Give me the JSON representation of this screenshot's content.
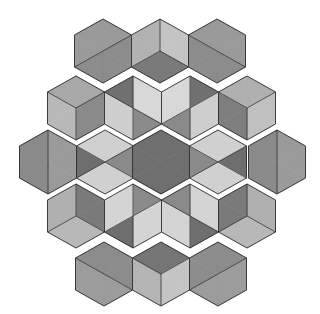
{
  "figure": {
    "width": 320,
    "height": 314,
    "background": "#ffffff",
    "hex": {
      "half_width": 28.5,
      "half_height": 32,
      "shoulder": 16
    },
    "triangle_order": [
      "top-upperright",
      "upperright-lowerright",
      "lowerright-bottom",
      "bottom-lowerleft",
      "lowerleft-upperleft",
      "upperleft-top"
    ],
    "palette": {
      "dark": "#6f6f6f",
      "medium_dark": "#8a8a8a",
      "medium": "#9a9a9a",
      "light_medium": "#b4b4b4",
      "light": "#d2d2d2"
    },
    "rows": [
      {
        "name": "row-1",
        "hexes": [
          {
            "cx": 103,
            "cy": 51,
            "fills": [
              "#9a9a9a",
              "#8c8c8c",
              "#8c8c8c",
              "#8c8c8c",
              "#9a9a9a",
              "#9a9a9a"
            ]
          },
          {
            "cx": 160,
            "cy": 51,
            "fills": [
              "#c4c4c4",
              "#c4c4c4",
              "#7a7a7a",
              "#7a7a7a",
              "#b2b2b2",
              "#b2b2b2"
            ]
          },
          {
            "cx": 217,
            "cy": 51,
            "fills": [
              "#9a9a9a",
              "#9a9a9a",
              "#8c8c8c",
              "#8c8c8c",
              "#8c8c8c",
              "#9a9a9a"
            ]
          }
        ]
      },
      {
        "name": "row-2",
        "hexes": [
          {
            "cx": 76,
            "cy": 108,
            "fills": [
              "#a8a8a8",
              "#8a8a8a",
              "#8a8a8a",
              "#b8b8b8",
              "#b8b8b8",
              "#a8a8a8"
            ]
          },
          {
            "cx": 133,
            "cy": 108,
            "fills": [
              "#d8d8d8",
              "#d8d8d8",
              "#8a8a8a",
              "#cecece",
              "#cecece",
              "#707070"
            ]
          },
          {
            "cx": 190,
            "cy": 108,
            "fills": [
              "#707070",
              "#cecece",
              "#cecece",
              "#8a8a8a",
              "#d8d8d8",
              "#d8d8d8"
            ]
          },
          {
            "cx": 247,
            "cy": 108,
            "fills": [
              "#b0b0b0",
              "#c0c0c0",
              "#c0c0c0",
              "#7e7e7e",
              "#7e7e7e",
              "#b0b0b0"
            ]
          }
        ]
      },
      {
        "name": "row-3",
        "hexes": [
          {
            "cx": 48,
            "cy": 162,
            "fills": [
              "#9a9a9a",
              "#9a9a9a",
              "#9a9a9a",
              "#8a8a8a",
              "#8a8a8a",
              "#8a8a8a"
            ]
          },
          {
            "cx": 105,
            "cy": 162,
            "fills": [
              "#d0d0d0",
              "#8a8a8a",
              "#d0d0d0",
              "#d0d0d0",
              "#6e6e6e",
              "#d0d0d0"
            ]
          },
          {
            "cx": 161,
            "cy": 162,
            "fills": [
              "#6f6f6f",
              "#6f6f6f",
              "#6f6f6f",
              "#6f6f6f",
              "#6f6f6f",
              "#6f6f6f"
            ]
          },
          {
            "cx": 218,
            "cy": 162,
            "fills": [
              "#d0d0d0",
              "#6e6e6e",
              "#d0d0d0",
              "#d0d0d0",
              "#8a8a8a",
              "#d0d0d0"
            ]
          },
          {
            "cx": 277,
            "cy": 162,
            "fills": [
              "#9a9a9a",
              "#9a9a9a",
              "#9a9a9a",
              "#8a8a8a",
              "#8a8a8a",
              "#8a8a8a"
            ]
          }
        ]
      },
      {
        "name": "row-4",
        "hexes": [
          {
            "cx": 76,
            "cy": 216,
            "fills": [
              "#7a7a7a",
              "#7a7a7a",
              "#b8b8b8",
              "#b8b8b8",
              "#b0b0b0",
              "#b0b0b0"
            ]
          },
          {
            "cx": 133,
            "cy": 216,
            "fills": [
              "#8a8a8a",
              "#d4d4d4",
              "#d4d4d4",
              "#6e6e6e",
              "#d4d4d4",
              "#d4d4d4"
            ]
          },
          {
            "cx": 190,
            "cy": 216,
            "fills": [
              "#d4d4d4",
              "#d4d4d4",
              "#6e6e6e",
              "#d4d4d4",
              "#d4d4d4",
              "#8a8a8a"
            ]
          },
          {
            "cx": 247,
            "cy": 216,
            "fills": [
              "#b0b0b0",
              "#b0b0b0",
              "#b8b8b8",
              "#b8b8b8",
              "#7a7a7a",
              "#7a7a7a"
            ]
          }
        ]
      },
      {
        "name": "row-5",
        "hexes": [
          {
            "cx": 104,
            "cy": 274,
            "fills": [
              "#8c8c8c",
              "#8c8c8c",
              "#9c9c9c",
              "#9c9c9c",
              "#9c9c9c",
              "#8c8c8c"
            ]
          },
          {
            "cx": 161,
            "cy": 274,
            "fills": [
              "#757575",
              "#c4c4c4",
              "#c4c4c4",
              "#b4b4b4",
              "#b4b4b4",
              "#757575"
            ]
          },
          {
            "cx": 218,
            "cy": 274,
            "fills": [
              "#8c8c8c",
              "#9c9c9c",
              "#9c9c9c",
              "#9c9c9c",
              "#8c8c8c",
              "#8c8c8c"
            ]
          }
        ]
      }
    ]
  }
}
